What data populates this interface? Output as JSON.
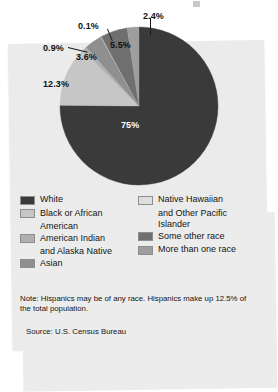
{
  "chart_data": {
    "type": "pie",
    "title": "",
    "subtitle": "",
    "xlabel": "",
    "ylabel": "",
    "legend_position": "bottom",
    "grid": false,
    "unit": "%",
    "categories": [
      "White",
      "Black or African American",
      "American Indian and Alaska Native",
      "Asian",
      "Native Hawaiian and Other Pacific Islander",
      "Some other race",
      "More than one race"
    ],
    "values": [
      75,
      12.3,
      0.9,
      3.6,
      0.1,
      5.5,
      2.4
    ],
    "labels": [
      "75%",
      "12.3%",
      "0.9%",
      "3.6%",
      "0.1%",
      "5.5%",
      "2.4%"
    ],
    "colors": [
      "#3a3a3a",
      "#c6c6c6",
      "#b0b0b0",
      "#8f8f8f",
      "#dedede",
      "#6f6f6f",
      "#9e9e9e"
    ],
    "annotations": [
      "Note: Hispanics may be of any race. Hispanics make up 12.5% of the total population.",
      "Source: U.S. Census Bureau"
    ]
  },
  "slices": [
    {
      "name": "white",
      "label": "75%",
      "value": 75,
      "color": "#3a3a3a",
      "label_color": "light",
      "label_x": 121,
      "label_y": 120
    },
    {
      "name": "black",
      "label": "12.3%",
      "value": 12.3,
      "color": "#c6c6c6",
      "label_color": "dark",
      "label_x": 43,
      "label_y": 79
    },
    {
      "name": "american-indian",
      "label": "0.9%",
      "value": 0.9,
      "color": "#b0b0b0",
      "label_color": "dark",
      "label_x": 43,
      "label_y": 43
    },
    {
      "name": "asian",
      "label": "3.6%",
      "value": 3.6,
      "color": "#8f8f8f",
      "label_color": "dark",
      "label_x": 76,
      "label_y": 52
    },
    {
      "name": "native-hawaiian",
      "label": "0.1%",
      "value": 0.1,
      "color": "#dedede",
      "label_color": "dark",
      "label_x": 78,
      "label_y": 21
    },
    {
      "name": "some-other-race",
      "label": "5.5%",
      "value": 5.5,
      "color": "#6f6f6f",
      "label_color": "dark",
      "label_x": 110,
      "label_y": 40
    },
    {
      "name": "more-than-one",
      "label": "2.4%",
      "value": 2.4,
      "color": "#9e9e9e",
      "label_color": "dark",
      "label_x": 143,
      "label_y": 11
    }
  ],
  "legend": {
    "left_column": [
      {
        "label": "White",
        "label2": "",
        "color": "#3a3a3a"
      },
      {
        "label": "Black or African",
        "label2": "American",
        "color": "#c6c6c6"
      },
      {
        "label": "American Indian",
        "label2": "and Alaska Native",
        "color": "#b0b0b0"
      },
      {
        "label": "Asian",
        "label2": "",
        "color": "#8f8f8f"
      }
    ],
    "right_column": [
      {
        "label": "Native Hawaiian",
        "label2": "and Other Pacific",
        "label3": "Islander",
        "color": "#dedede"
      },
      {
        "label": "Some other race",
        "label2": "",
        "label3": "",
        "color": "#6f6f6f"
      },
      {
        "label": "More than one race",
        "label2": "",
        "label3": "",
        "color": "#9e9e9e"
      }
    ]
  },
  "note": "Note: Hispanics may be of any race. Hispanics make up 12.5% of the total population.",
  "source": "Source: U.S. Census Bureau"
}
